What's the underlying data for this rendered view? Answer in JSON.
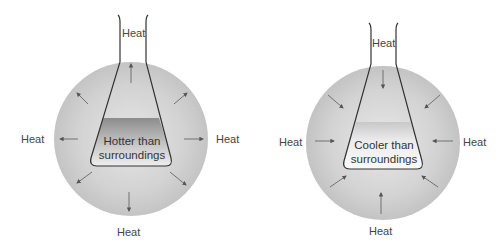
{
  "panels": [
    {
      "id": "exothermic",
      "flask_label_line1": "Hotter than",
      "flask_label_line2": "surroundings",
      "heat_direction": "outward",
      "labels": {
        "top": "Heat",
        "left": "Heat",
        "right": "Heat",
        "bottom": "Heat"
      }
    },
    {
      "id": "endothermic",
      "flask_label_line1": "Cooler than",
      "flask_label_line2": "surroundings",
      "heat_direction": "inward",
      "labels": {
        "top": "Heat",
        "left": "Heat",
        "right": "Heat",
        "bottom": "Heat"
      }
    }
  ],
  "colors": {
    "background": "#ffffff",
    "sphere": "#c9c9c9",
    "flask_outline": "#333333",
    "arrow": "#555555",
    "hot_liquid": "#8a8a8a"
  }
}
